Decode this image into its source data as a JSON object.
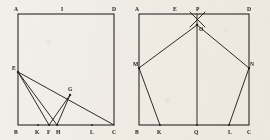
{
  "page": {
    "background_color": "#f2efe9",
    "ink_color": "#24201b",
    "width": 270,
    "height": 140
  },
  "figures": [
    {
      "id": "figure-left",
      "name": "left-construction",
      "frame": {
        "x": 18,
        "y": 14,
        "width": 96,
        "height": 111
      },
      "labels": [
        {
          "key": "A",
          "text": "A",
          "x": 14,
          "y": 11
        },
        {
          "key": "I",
          "text": "I",
          "x": 61,
          "y": 11
        },
        {
          "key": "D_top",
          "text": "D",
          "x": 112,
          "y": 11
        },
        {
          "key": "E",
          "text": "E",
          "x": 12,
          "y": 70
        },
        {
          "key": "G",
          "text": "G",
          "x": 68,
          "y": 91
        },
        {
          "key": "B",
          "text": "B",
          "x": 14,
          "y": 134
        },
        {
          "key": "K",
          "text": "K",
          "x": 35,
          "y": 134
        },
        {
          "key": "F",
          "text": "F",
          "x": 47,
          "y": 134
        },
        {
          "key": "H",
          "text": "H",
          "x": 56,
          "y": 134
        },
        {
          "key": "L",
          "text": "L",
          "x": 90,
          "y": 134
        },
        {
          "key": "C",
          "text": "C",
          "x": 112,
          "y": 134
        }
      ],
      "points": {
        "A": [
          18,
          14
        ],
        "D": [
          114,
          14
        ],
        "B": [
          18,
          125
        ],
        "C": [
          114,
          125
        ],
        "E": [
          18,
          72
        ],
        "G": [
          70,
          95
        ],
        "K": [
          38,
          125
        ],
        "F": [
          49,
          125
        ],
        "H": [
          57,
          125
        ],
        "L": [
          92,
          125
        ]
      },
      "segments": [
        {
          "from": "E",
          "to": "C",
          "name": "segment-EC"
        },
        {
          "from": "E",
          "to": "F",
          "name": "segment-EF"
        },
        {
          "from": "E",
          "to": "H",
          "name": "segment-EH"
        },
        {
          "from": "G",
          "to": "F",
          "name": "segment-GF"
        },
        {
          "from": "G",
          "to": "H",
          "name": "segment-GH"
        }
      ]
    },
    {
      "id": "figure-right",
      "name": "right-pentagon-construction",
      "frame": {
        "x": 139,
        "y": 14,
        "width": 110,
        "height": 111
      },
      "labels": [
        {
          "key": "A",
          "text": "A",
          "x": 135,
          "y": 11
        },
        {
          "key": "E",
          "text": "E",
          "x": 173,
          "y": 11
        },
        {
          "key": "P",
          "text": "P",
          "x": 196,
          "y": 11
        },
        {
          "key": "D_top",
          "text": "D",
          "x": 247,
          "y": 11
        },
        {
          "key": "O",
          "text": "O",
          "x": 198,
          "y": 30
        },
        {
          "key": "M",
          "text": "M",
          "x": 134,
          "y": 66
        },
        {
          "key": "N",
          "text": "N",
          "x": 249,
          "y": 66
        },
        {
          "key": "B",
          "text": "B",
          "x": 135,
          "y": 134
        },
        {
          "key": "K",
          "text": "K",
          "x": 157,
          "y": 134
        },
        {
          "key": "Q",
          "text": "Q",
          "x": 194,
          "y": 134
        },
        {
          "key": "L",
          "text": "L",
          "x": 228,
          "y": 134
        },
        {
          "key": "C",
          "text": "C",
          "x": 247,
          "y": 134
        }
      ],
      "points": {
        "A": [
          139,
          14
        ],
        "D": [
          249,
          14
        ],
        "B": [
          139,
          125
        ],
        "C": [
          249,
          125
        ],
        "P": [
          197,
          14
        ],
        "O": [
          197,
          25
        ],
        "M": [
          139,
          68
        ],
        "N": [
          249,
          68
        ],
        "K": [
          160,
          125
        ],
        "Q": [
          197,
          125
        ],
        "L": [
          229,
          125
        ]
      },
      "segments": [
        {
          "from": "P",
          "to": "Q",
          "name": "segment-PQ-axis"
        },
        {
          "from": "M",
          "to": "O",
          "name": "segment-MO"
        },
        {
          "from": "N",
          "to": "O",
          "name": "segment-NO"
        },
        {
          "from": "M",
          "to": "K",
          "name": "segment-MK"
        },
        {
          "from": "N",
          "to": "L",
          "name": "segment-NL"
        },
        {
          "from": "A",
          "to": "O",
          "name": "segment-AO-cross"
        },
        {
          "from": "D",
          "to": "O",
          "name": "segment-DO-cross"
        }
      ]
    }
  ]
}
